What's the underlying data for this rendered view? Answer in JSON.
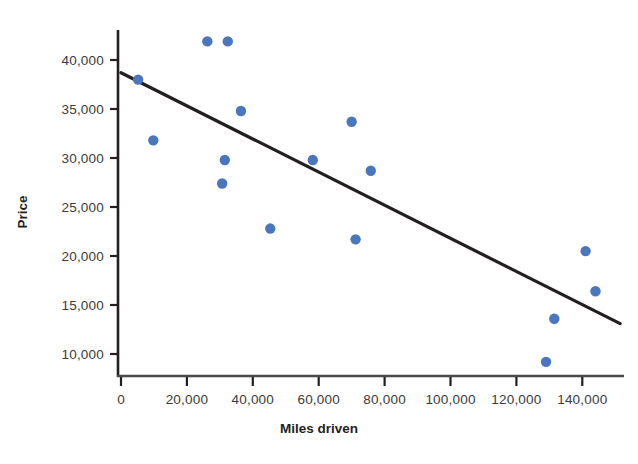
{
  "chart_data": {
    "type": "scatter",
    "title": "",
    "xlabel": "Miles driven",
    "ylabel": "Price",
    "xlim": [
      -6000,
      157000
    ],
    "ylim": [
      7200,
      43500
    ],
    "grid": false,
    "legend": null,
    "xticks": [
      0,
      20000,
      40000,
      60000,
      80000,
      100000,
      120000,
      140000
    ],
    "xtick_labels": [
      "0",
      "20,000",
      "40,000",
      "60,000",
      "80,000",
      "100,000",
      "120,000",
      "140,000"
    ],
    "yticks": [
      10000,
      15000,
      20000,
      25000,
      30000,
      35000,
      40000
    ],
    "ytick_labels": [
      "10,000",
      "15,000",
      "20,000",
      "25,000",
      "30,000",
      "35,000",
      "40,000"
    ],
    "series": [
      {
        "name": "Used cars",
        "marker": "circle",
        "color": "#4a76bd",
        "points": [
          {
            "x": 5200,
            "y": 38000
          },
          {
            "x": 9800,
            "y": 31800
          },
          {
            "x": 26200,
            "y": 41900
          },
          {
            "x": 31500,
            "y": 29800
          },
          {
            "x": 30700,
            "y": 27400
          },
          {
            "x": 32400,
            "y": 41900
          },
          {
            "x": 36400,
            "y": 34800
          },
          {
            "x": 45300,
            "y": 22800
          },
          {
            "x": 58200,
            "y": 29800
          },
          {
            "x": 70000,
            "y": 33700
          },
          {
            "x": 71200,
            "y": 21700
          },
          {
            "x": 75800,
            "y": 28700
          },
          {
            "x": 129000,
            "y": 9200
          },
          {
            "x": 131500,
            "y": 13600
          },
          {
            "x": 141000,
            "y": 20500
          },
          {
            "x": 144000,
            "y": 16400
          }
        ]
      }
    ],
    "trendline": {
      "name": "least-squares regression line",
      "color": "#231f20",
      "x_start": 0,
      "y_start": 38700,
      "x_end": 151500,
      "y_end": 13100
    }
  },
  "axis": {
    "x_axis_name": "x-axis",
    "y_axis_name": "y-axis"
  },
  "title_fragment": ""
}
